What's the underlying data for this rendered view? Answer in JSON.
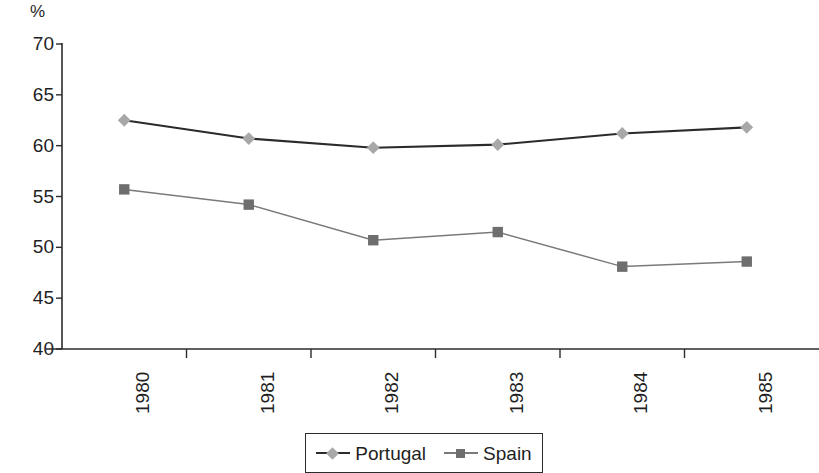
{
  "chart_data": {
    "type": "line",
    "title": "",
    "subtitle": "",
    "xlabel": "",
    "ylabel": "%",
    "unit_label": "%",
    "categories": [
      "1980",
      "1981",
      "1982",
      "1983",
      "1984",
      "1985"
    ],
    "ylim": [
      40,
      70
    ],
    "yticks": [
      40,
      45,
      50,
      55,
      60,
      65,
      70
    ],
    "ytick_labels": [
      "40",
      "45",
      "50",
      "55",
      "60",
      "65",
      "70"
    ],
    "grid": false,
    "legend_position": "bottom-center",
    "series": [
      {
        "name": "Portugal",
        "marker": "diamond",
        "line_color": "#2b2b2b",
        "marker_color": "#a8a8a8",
        "values": [
          62.5,
          60.7,
          59.8,
          60.1,
          61.2,
          61.8
        ]
      },
      {
        "name": "Spain",
        "marker": "square",
        "line_color": "#7a7a7a",
        "marker_color": "#6e6e6e",
        "values": [
          55.7,
          54.2,
          50.7,
          51.5,
          48.1,
          48.6
        ]
      }
    ]
  },
  "legend": {
    "entries": [
      {
        "label": "Portugal"
      },
      {
        "label": "Spain"
      }
    ]
  },
  "colors": {
    "axis": "#2b2b2b",
    "portugal_line": "#2b2b2b",
    "portugal_marker": "#a8a8a8",
    "spain_line": "#7a7a7a",
    "spain_marker": "#6e6e6e",
    "text": "#1f1f1f",
    "background": "#ffffff"
  }
}
